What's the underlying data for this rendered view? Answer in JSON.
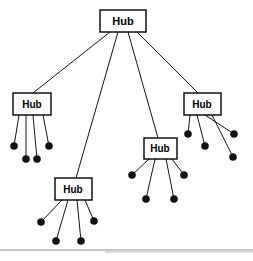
{
  "diagram": {
    "type": "hierarchical-star-network-topology",
    "canvas": {
      "width": 253,
      "height": 261,
      "background": "#ffffff"
    },
    "style": {
      "line_color": "#141414",
      "node_fill": "#111111",
      "box_stroke": "#000000",
      "box_fill": "#ffffff",
      "label_color": "#000000",
      "rule_color": "#8d8d8d"
    },
    "root": {
      "label": "Hub",
      "name": "root-hub",
      "box": {
        "x": 100,
        "y": 10,
        "w": 46,
        "h": 22
      },
      "label_pos": {
        "x": 123,
        "y": 22
      },
      "font_size": 11
    },
    "hubs": [
      {
        "label": "Hub",
        "name": "hub-left",
        "box": {
          "x": 13,
          "y": 93,
          "w": 38,
          "h": 22
        },
        "label_pos": {
          "x": 32,
          "y": 105
        },
        "font_size": 10,
        "uplink": {
          "x1": 110,
          "y1": 32,
          "x2": 33,
          "y2": 93
        },
        "leaves": [
          {
            "cx": 14,
            "cy": 146,
            "r": 3.6,
            "from_x": 19,
            "from_y": 115
          },
          {
            "cx": 26,
            "cy": 159,
            "r": 3.6,
            "from_x": 26,
            "from_y": 115
          },
          {
            "cx": 37,
            "cy": 159,
            "r": 3.6,
            "from_x": 33,
            "from_y": 115
          },
          {
            "cx": 49,
            "cy": 146,
            "r": 3.6,
            "from_x": 43,
            "from_y": 115
          }
        ]
      },
      {
        "label": "Hub",
        "name": "hub-bottom",
        "box": {
          "x": 55,
          "y": 178,
          "w": 37,
          "h": 22
        },
        "label_pos": {
          "x": 73,
          "y": 190
        },
        "font_size": 10,
        "uplink": {
          "x1": 118,
          "y1": 32,
          "x2": 76,
          "y2": 178
        },
        "leaves": [
          {
            "cx": 41,
            "cy": 222,
            "r": 3.6,
            "from_x": 62,
            "from_y": 200
          },
          {
            "cx": 56,
            "cy": 241,
            "r": 3.6,
            "from_x": 68,
            "from_y": 200
          },
          {
            "cx": 81,
            "cy": 241,
            "r": 3.6,
            "from_x": 77,
            "from_y": 200
          },
          {
            "cx": 94,
            "cy": 221,
            "r": 3.6,
            "from_x": 85,
            "from_y": 200
          }
        ]
      },
      {
        "label": "Hub",
        "name": "hub-middle",
        "box": {
          "x": 144,
          "y": 138,
          "w": 33,
          "h": 21
        },
        "label_pos": {
          "x": 160,
          "y": 149
        },
        "font_size": 10,
        "uplink": {
          "x1": 128,
          "y1": 32,
          "x2": 158,
          "y2": 138
        },
        "leaves": [
          {
            "cx": 132,
            "cy": 175,
            "r": 3.6,
            "from_x": 149,
            "from_y": 159
          },
          {
            "cx": 146,
            "cy": 199,
            "r": 3.6,
            "from_x": 155,
            "from_y": 159
          },
          {
            "cx": 174,
            "cy": 199,
            "r": 3.6,
            "from_x": 166,
            "from_y": 159
          },
          {
            "cx": 184,
            "cy": 175,
            "r": 3.6,
            "from_x": 172,
            "from_y": 159
          }
        ]
      },
      {
        "label": "Hub",
        "name": "hub-right",
        "box": {
          "x": 184,
          "y": 93,
          "w": 37,
          "h": 22
        },
        "label_pos": {
          "x": 202,
          "y": 105
        },
        "font_size": 10,
        "uplink": {
          "x1": 137,
          "y1": 32,
          "x2": 198,
          "y2": 93
        },
        "leaves": [
          {
            "cx": 188,
            "cy": 134,
            "r": 3.6,
            "from_x": 190,
            "from_y": 115
          },
          {
            "cx": 205,
            "cy": 146,
            "r": 3.6,
            "from_x": 197,
            "from_y": 115
          },
          {
            "cx": 234,
            "cy": 134,
            "r": 3.6,
            "from_x": 205,
            "from_y": 115
          },
          {
            "cx": 233,
            "cy": 157,
            "r": 3.6,
            "from_x": 212,
            "from_y": 115
          }
        ]
      }
    ],
    "footer_rules": [
      {
        "x1": 0,
        "y1": 250,
        "x2": 253,
        "y2": 250,
        "name": "footer-divider-primary"
      },
      {
        "x1": 105,
        "y1": 252,
        "x2": 253,
        "y2": 252,
        "name": "footer-divider-secondary"
      }
    ]
  }
}
